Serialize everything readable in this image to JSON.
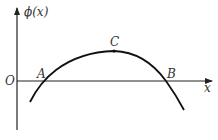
{
  "diagram": {
    "y_axis_label": "ϕ(x)",
    "x_axis_label": "x",
    "origin_label": "O",
    "points": [
      {
        "id": "A",
        "label": "A",
        "description": "left zero crossing"
      },
      {
        "id": "B",
        "label": "B",
        "description": "right zero crossing"
      },
      {
        "id": "C",
        "label": "C",
        "description": "maximum of curve"
      }
    ],
    "curve": "downward-opening parabola-like curve crossing x-axis at A and B with peak at C",
    "stroke_color": "#111111"
  }
}
